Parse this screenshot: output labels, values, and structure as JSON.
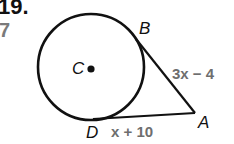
{
  "problem": {
    "number": "19.",
    "side_number": "7"
  },
  "figure": {
    "circle": {
      "cx": 91,
      "cy": 67,
      "r": 53,
      "stroke": "#111111"
    },
    "center": {
      "label": "C",
      "dot_x": 91,
      "dot_y": 69
    },
    "points": {
      "B": {
        "label": "B",
        "x": 138,
        "y": 40
      },
      "D": {
        "label": "D",
        "x": 95,
        "y": 119
      },
      "A": {
        "label": "A",
        "x": 195,
        "y": 113
      }
    },
    "segments": {
      "AB": {
        "label": "3x − 4"
      },
      "AD": {
        "label": "x + 10"
      }
    }
  }
}
